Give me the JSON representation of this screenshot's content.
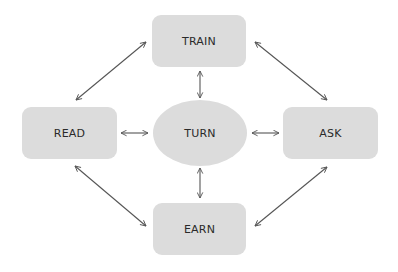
{
  "diagram": {
    "type": "cycle-hub",
    "colors": {
      "node_fill": "#dcdcdc",
      "text": "#2a2a2a",
      "arrow": "#555555",
      "background": "#ffffff"
    },
    "nodes": [
      {
        "id": "train",
        "label": "TRAIN",
        "shape": "rounded-rect",
        "position": "top"
      },
      {
        "id": "read",
        "label": "READ",
        "shape": "rounded-rect",
        "position": "left"
      },
      {
        "id": "turn",
        "label": "TURN",
        "shape": "ellipse",
        "position": "center"
      },
      {
        "id": "ask",
        "label": "ASK",
        "shape": "rounded-rect",
        "position": "right"
      },
      {
        "id": "earn",
        "label": "EARN",
        "shape": "rounded-rect",
        "position": "bottom"
      }
    ],
    "edges": [
      {
        "from": "read",
        "to": "train",
        "direction": "bidirectional"
      },
      {
        "from": "train",
        "to": "ask",
        "direction": "bidirectional"
      },
      {
        "from": "read",
        "to": "earn",
        "direction": "bidirectional"
      },
      {
        "from": "earn",
        "to": "ask",
        "direction": "bidirectional"
      },
      {
        "from": "turn",
        "to": "train",
        "direction": "bidirectional"
      },
      {
        "from": "turn",
        "to": "earn",
        "direction": "bidirectional"
      },
      {
        "from": "turn",
        "to": "read",
        "direction": "bidirectional"
      },
      {
        "from": "turn",
        "to": "ask",
        "direction": "bidirectional"
      }
    ]
  }
}
